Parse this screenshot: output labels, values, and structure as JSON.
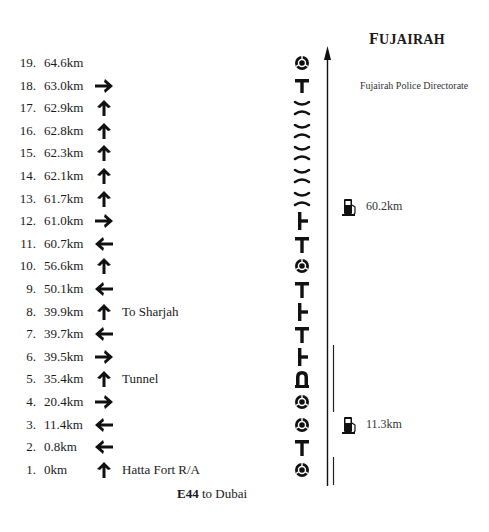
{
  "title": {
    "first": "F",
    "rest": "UJAIRAH"
  },
  "destination_label": "Fujairah Police Directorate",
  "footer": {
    "road": "E44",
    "text": " to Dubai"
  },
  "fuel_stations": [
    {
      "label": "60.2km"
    },
    {
      "label": "11.3km"
    }
  ],
  "route": [
    {
      "num": "19.",
      "dist": "64.6km",
      "arrow": "none",
      "note": "",
      "symbol": "roundabout"
    },
    {
      "num": "18.",
      "dist": "63.0km",
      "arrow": "right",
      "note": "",
      "symbol": "t-junction"
    },
    {
      "num": "17.",
      "dist": "62.9km",
      "arrow": "up",
      "note": "",
      "symbol": "bridge"
    },
    {
      "num": "16.",
      "dist": "62.8km",
      "arrow": "up",
      "note": "",
      "symbol": "bridge"
    },
    {
      "num": "15.",
      "dist": "62.3km",
      "arrow": "up",
      "note": "",
      "symbol": "bridge"
    },
    {
      "num": "14.",
      "dist": "62.1km",
      "arrow": "up",
      "note": "",
      "symbol": "bridge"
    },
    {
      "num": "13.",
      "dist": "61.7km",
      "arrow": "up",
      "note": "",
      "symbol": "bridge"
    },
    {
      "num": "12.",
      "dist": "61.0km",
      "arrow": "right",
      "note": "",
      "symbol": "junction-right"
    },
    {
      "num": "11.",
      "dist": "60.7km",
      "arrow": "left",
      "note": "",
      "symbol": "junction-left"
    },
    {
      "num": "10.",
      "dist": "56.6km",
      "arrow": "up",
      "note": "",
      "symbol": "roundabout"
    },
    {
      "num": "9.",
      "dist": "50.1km",
      "arrow": "left",
      "note": "",
      "symbol": "junction-left"
    },
    {
      "num": "8.",
      "dist": "39.9km",
      "arrow": "up",
      "note": "To Sharjah",
      "symbol": "junction-right"
    },
    {
      "num": "7.",
      "dist": "39.7km",
      "arrow": "left",
      "note": "",
      "symbol": "junction-left"
    },
    {
      "num": "6.",
      "dist": "39.5km",
      "arrow": "right",
      "note": "",
      "symbol": "junction-right"
    },
    {
      "num": "5.",
      "dist": "35.4km",
      "arrow": "up",
      "note": "Tunnel",
      "symbol": "tunnel"
    },
    {
      "num": "4.",
      "dist": "20.4km",
      "arrow": "right",
      "note": "",
      "symbol": "roundabout"
    },
    {
      "num": "3.",
      "dist": "11.4km",
      "arrow": "left",
      "note": "",
      "symbol": "roundabout"
    },
    {
      "num": "2.",
      "dist": "0.8km",
      "arrow": "left",
      "note": "",
      "symbol": "junction-left"
    },
    {
      "num": "1.",
      "dist": "0km",
      "arrow": "up",
      "note": "Hatta Fort R/A",
      "symbol": "roundabout"
    }
  ]
}
